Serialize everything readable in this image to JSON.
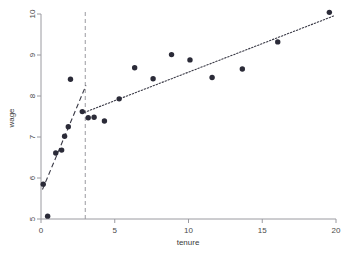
{
  "chart_data": {
    "type": "scatter",
    "title": "",
    "subtitle": "",
    "xlabel": "tenure",
    "ylabel": "wage",
    "xlim": [
      0,
      20
    ],
    "ylim": [
      5,
      10
    ],
    "xticks": [
      0,
      5,
      10,
      15,
      20
    ],
    "yticks": [
      5,
      6,
      7,
      8,
      9,
      10
    ],
    "xticklabels": [
      "0",
      "5",
      "10",
      "15",
      "20"
    ],
    "yticklabels": [
      "5",
      "6",
      "7",
      "8",
      "9",
      "10"
    ],
    "grid": false,
    "legend": "none",
    "series": [
      {
        "name": "observations",
        "type": "scatter",
        "marker": "filled-circle",
        "color": "#2b2b38",
        "points": [
          {
            "x": 0.15,
            "y": 5.85
          },
          {
            "x": 0.45,
            "y": 5.07
          },
          {
            "x": 1.0,
            "y": 6.61
          },
          {
            "x": 1.4,
            "y": 6.68
          },
          {
            "x": 1.6,
            "y": 7.02
          },
          {
            "x": 1.85,
            "y": 7.25
          },
          {
            "x": 2.0,
            "y": 8.41
          },
          {
            "x": 2.8,
            "y": 7.62
          },
          {
            "x": 3.2,
            "y": 7.47
          },
          {
            "x": 3.6,
            "y": 7.48
          },
          {
            "x": 4.3,
            "y": 7.39
          },
          {
            "x": 5.3,
            "y": 7.93
          },
          {
            "x": 6.35,
            "y": 8.69
          },
          {
            "x": 7.6,
            "y": 8.42
          },
          {
            "x": 8.85,
            "y": 9.01
          },
          {
            "x": 10.1,
            "y": 8.88
          },
          {
            "x": 11.6,
            "y": 8.45
          },
          {
            "x": 13.65,
            "y": 8.66
          },
          {
            "x": 16.05,
            "y": 9.32
          },
          {
            "x": 19.55,
            "y": 10.04
          }
        ]
      },
      {
        "name": "fitted-segment-low-tenure",
        "type": "line",
        "style": "dashed",
        "color": "#3a3a46",
        "points": [
          {
            "x": 0.1,
            "y": 5.72
          },
          {
            "x": 3.05,
            "y": 8.26
          }
        ]
      },
      {
        "name": "fitted-segment-high-tenure",
        "type": "line",
        "style": "dotted",
        "color": "#3a3a46",
        "points": [
          {
            "x": 2.95,
            "y": 7.6
          },
          {
            "x": 19.9,
            "y": 9.96
          }
        ]
      }
    ],
    "annotations": [
      {
        "name": "knot-reference-line",
        "type": "vline",
        "x": 3.0,
        "style": "dashed",
        "color": "#9a9aa0",
        "label": ""
      }
    ]
  },
  "axes": {
    "x_title": "tenure",
    "y_title": "wage"
  }
}
